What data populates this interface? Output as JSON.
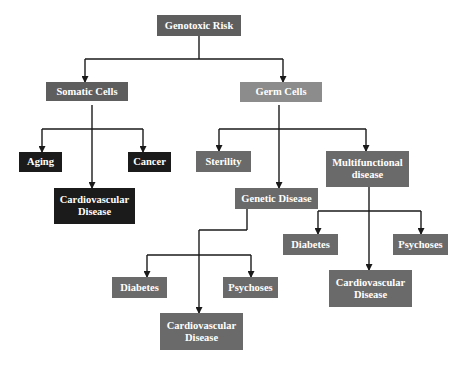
{
  "diagram": {
    "type": "hierarchy-tree",
    "colors": {
      "root": "#5e5e5e",
      "somatic": "#5e5e5e",
      "germ": "#8c8c8c",
      "somatic_children": "#1b1b1b",
      "germ_children": "#6a6a6a",
      "lines": "#1a1a1a",
      "text": "#ffffff"
    },
    "nodes": {
      "root": {
        "label": "Genotoxic Risk"
      },
      "somatic": {
        "label": "Somatic Cells"
      },
      "germ": {
        "label": "Germ Cells"
      },
      "aging": {
        "label": "Aging"
      },
      "cancer": {
        "label": "Cancer"
      },
      "somatic_cardio": {
        "label": "Cardiovascular Disease"
      },
      "sterility": {
        "label": "Sterility"
      },
      "multifunctional": {
        "label": "Multifunctional disease"
      },
      "genetic": {
        "label": "Genetic Disease"
      },
      "genetic_diabetes": {
        "label": "Diabetes"
      },
      "genetic_psychoses": {
        "label": "Psychoses"
      },
      "genetic_cardio": {
        "label": "Cardiovascular Disease"
      },
      "multi_diabetes": {
        "label": "Diabetes"
      },
      "multi_psychoses": {
        "label": "Psychoses"
      },
      "multi_cardio": {
        "label": "Cardiovascular Disease"
      }
    },
    "edges": [
      [
        "Genotoxic Risk",
        "Somatic Cells"
      ],
      [
        "Genotoxic Risk",
        "Germ Cells"
      ],
      [
        "Somatic Cells",
        "Aging"
      ],
      [
        "Somatic Cells",
        "Cancer"
      ],
      [
        "Somatic Cells",
        "Cardiovascular Disease"
      ],
      [
        "Germ Cells",
        "Sterility"
      ],
      [
        "Germ Cells",
        "Multifunctional disease"
      ],
      [
        "Germ Cells",
        "Genetic Disease"
      ],
      [
        "Genetic Disease",
        "Diabetes"
      ],
      [
        "Genetic Disease",
        "Psychoses"
      ],
      [
        "Genetic Disease",
        "Cardiovascular Disease"
      ],
      [
        "Multifunctional disease",
        "Diabetes"
      ],
      [
        "Multifunctional disease",
        "Psychoses"
      ],
      [
        "Multifunctional disease",
        "Cardiovascular Disease"
      ]
    ]
  }
}
